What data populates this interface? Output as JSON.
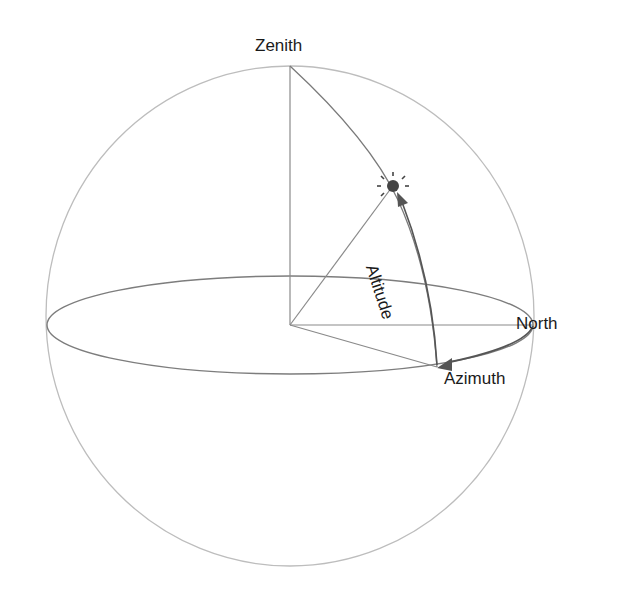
{
  "diagram": {
    "labels": {
      "zenith": "Zenith",
      "north": "North",
      "altitude": "Altitude",
      "azimuth": "Azimuth"
    },
    "icons": {
      "sun": "sun-icon",
      "observer_center": "origin-point"
    },
    "colors": {
      "sphere_outline": "#b8b8b8",
      "horizon_ellipse": "#7a7a7a",
      "lines": "#8a8a8a",
      "arrows": "#555555",
      "sun": "#444444",
      "text": "#1a1a1a"
    }
  }
}
